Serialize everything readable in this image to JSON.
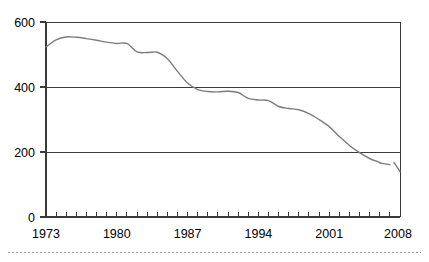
{
  "chart_data": {
    "type": "line",
    "title": "",
    "subtitle": "",
    "xlabel": "",
    "ylabel": "",
    "xlim": [
      1973,
      2008
    ],
    "ylim": [
      0,
      600
    ],
    "yticks": [
      0,
      200,
      400,
      600
    ],
    "ytick_labels": [
      "0",
      "200",
      "400",
      "600"
    ],
    "xticks": [
      1973,
      1980,
      1987,
      1994,
      2001,
      2008
    ],
    "xtick_labels": [
      "1973",
      "1980",
      "1987",
      "1994",
      "2001",
      "2008"
    ],
    "x_minor_tick_interval": 1,
    "grid": "horizontal",
    "legend": "none",
    "line_color": "#7d7d7d",
    "axis_color": "#3a3a3a",
    "series": [
      {
        "name": "series-1",
        "segment": "main",
        "x": [
          1973,
          1974,
          1975,
          1976,
          1977,
          1978,
          1979,
          1980,
          1981,
          1982,
          1983,
          1984,
          1985,
          1986,
          1987,
          1988,
          1989,
          1990,
          1991,
          1992,
          1993,
          1994,
          1995,
          1996,
          1997,
          1998,
          1999,
          2000,
          2001,
          2002,
          2003,
          2004,
          2005,
          2006
        ],
        "values": [
          523,
          545,
          554,
          553,
          549,
          544,
          538,
          534,
          534,
          508,
          506,
          507,
          487,
          448,
          412,
          392,
          386,
          385,
          387,
          383,
          365,
          360,
          358,
          340,
          334,
          330,
          318,
          300,
          278,
          248,
          220,
          198,
          180,
          168
        ]
      },
      {
        "name": "series-1",
        "segment": "break-after-2006",
        "x": [
          2006,
          2007
        ],
        "values": [
          166,
          161
        ]
      },
      {
        "name": "series-1",
        "segment": "final",
        "x": [
          2007.4,
          2008
        ],
        "values": [
          168,
          140
        ]
      }
    ]
  },
  "footer": {
    "separator": "dotted-rule"
  }
}
